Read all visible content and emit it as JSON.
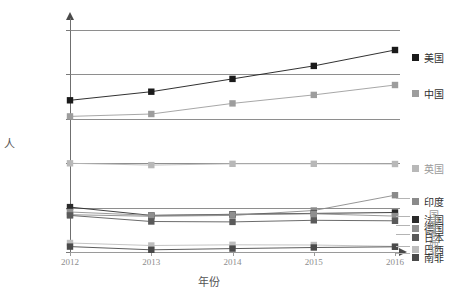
{
  "chart_data": {
    "type": "line",
    "title": "",
    "xlabel": "年份",
    "ylabel": "人",
    "x": [
      "2012",
      "2013",
      "2014",
      "2015",
      "2016"
    ],
    "ylim": [
      0,
      989000
    ],
    "yticks": [
      0,
      198000,
      395000,
      593000,
      791000,
      989000
    ],
    "ytick_labels": [
      "0",
      "198K",
      "395K",
      "593K",
      "791K",
      "989K"
    ],
    "grid": true,
    "legend_position": "right",
    "series": [
      {
        "name": "美国",
        "color": "#1a1a1a",
        "values": [
          676000,
          714000,
          771000,
          829000,
          900000
        ]
      },
      {
        "name": "中国",
        "color": "#9d9d9d",
        "values": [
          604000,
          615000,
          662000,
          700000,
          744000
        ]
      },
      {
        "name": "英国",
        "color": "#b8b8b8",
        "values": [
          395000,
          387000,
          393000,
          393000,
          392000
        ]
      },
      {
        "name": "印度",
        "color": "#8a8a8a",
        "values": [
          166000,
          159000,
          163000,
          185000,
          253000
        ]
      },
      {
        "name": "法国",
        "color": "#2a2a2a",
        "values": [
          200000,
          163000,
          168000,
          172000,
          176000
        ]
      },
      {
        "name": "德国",
        "color": "#8f8f8f",
        "values": [
          178000,
          163000,
          166000,
          170000,
          160000
        ]
      },
      {
        "name": "日本",
        "color": "#5a5a5a",
        "values": [
          163000,
          136000,
          134000,
          141000,
          139000
        ]
      },
      {
        "name": "巴西",
        "color": "#bdbdbd",
        "values": [
          40000,
          29000,
          32000,
          31000,
          25000
        ]
      },
      {
        "name": "南非",
        "color": "#4a4a4a",
        "values": [
          24000,
          10000,
          15000,
          20000,
          23000
        ]
      }
    ]
  },
  "legend": {
    "items": [
      {
        "label": "美国",
        "color": "#1a1a1a",
        "dim": false
      },
      {
        "label": "中国",
        "color": "#9d9d9d",
        "dim": false
      },
      {
        "label": "英国",
        "color": "#b8b8b8",
        "dim": true
      },
      {
        "label": "印度",
        "color": "#8a8a8a",
        "dim": false
      },
      {
        "label": "法国",
        "color": "#2a2a2a",
        "dim": false
      },
      {
        "label": "德国",
        "color": "#8f8f8f",
        "dim": false
      },
      {
        "label": "日本",
        "color": "#5a5a5a",
        "dim": false
      },
      {
        "label": "巴西",
        "color": "#bdbdbd",
        "dim": false
      },
      {
        "label": "南非",
        "color": "#4a4a4a",
        "dim": false
      },
      {
        "label": "国",
        "color": "#8f8f8f",
        "dim": true
      },
      {
        "label": "国",
        "color": "#8f8f8f",
        "dim": true
      },
      {
        "label": "本",
        "color": "#8f8f8f",
        "dim": true
      },
      {
        "label": "西",
        "color": "#8f8f8f",
        "dim": true
      },
      {
        "label": "非",
        "color": "#8f8f8f",
        "dim": true
      }
    ]
  }
}
